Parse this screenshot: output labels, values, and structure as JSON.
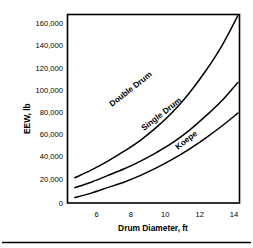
{
  "chart_data": {
    "type": "line",
    "title": "",
    "xlabel": "Drum Diameter, ft",
    "ylabel": "EEW, lb",
    "xlim": [
      4.55,
      15.1
    ],
    "ylim": [
      0,
      172000
    ],
    "grid": false,
    "legend_position": "inline-curve-labels",
    "xticks": [
      6,
      8,
      10,
      12,
      14
    ],
    "xtick_labels": [
      "6",
      "8",
      "10",
      "12",
      "14"
    ],
    "yticks": [
      0,
      20000,
      40000,
      60000,
      80000,
      100000,
      120000,
      140000,
      160000
    ],
    "ytick_labels": [
      "0",
      "20,000",
      "40,000",
      "60,000",
      "80,000",
      "100,000",
      "120,000",
      "140,000",
      "160,000"
    ],
    "x": [
      5,
      6,
      7,
      8,
      9,
      10,
      11,
      12,
      13,
      14,
      15
    ],
    "series": [
      {
        "name": "Double Drum",
        "label": "Double Drum",
        "values": [
          23000,
          30000,
          38000,
          47000,
          57000,
          69000,
          83000,
          100000,
          120000,
          143000,
          171000
        ]
      },
      {
        "name": "Single Drum",
        "label": "Single Drum",
        "values": [
          14000,
          19000,
          25000,
          31000,
          38000,
          46000,
          55000,
          66000,
          79000,
          93000,
          110000
        ]
      },
      {
        "name": "Koepe",
        "label": "Koepe",
        "values": [
          5000,
          9000,
          14000,
          19000,
          25000,
          32000,
          40000,
          49000,
          59000,
          70000,
          82000
        ]
      }
    ],
    "colors": {
      "curve": "#000000",
      "axis": "#000000",
      "background": "#ffffff"
    }
  }
}
